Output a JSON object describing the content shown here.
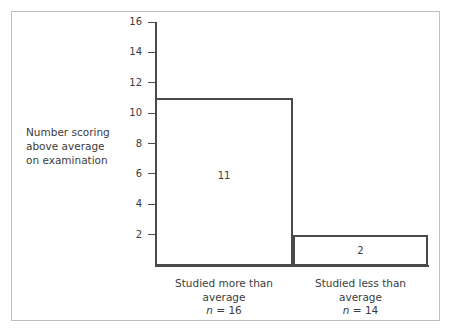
{
  "chart_data": {
    "type": "bar",
    "title": "",
    "subtitle": "",
    "xlabel": "",
    "ylabel": "Number scoring above average on examination",
    "ylabel_lines": [
      "Number scoring",
      "above average",
      "on examination"
    ],
    "categories": [
      "Studied more than average",
      "Studied less than average"
    ],
    "category_lines": [
      [
        "Studied more than",
        "average"
      ],
      [
        "Studied less than",
        "average"
      ]
    ],
    "category_n_labels": [
      "n = 16",
      "n = 14"
    ],
    "category_n_values": [
      16,
      14
    ],
    "values": [
      11,
      2
    ],
    "value_labels": [
      "11",
      "2"
    ],
    "ylim": [
      0,
      16
    ],
    "ytick_values": [
      2,
      4,
      6,
      8,
      10,
      12,
      14,
      16
    ],
    "ytick_labels": [
      "2",
      "4",
      "6",
      "8",
      "10",
      "12",
      "14",
      "16"
    ],
    "grid": false,
    "legend": null,
    "bar_fill_color": "#ffffff",
    "bar_border_color": "#4a4a4a",
    "axis_color": "#4a4a4a",
    "text_color": "#3c3c3c",
    "frame_border_color": "#bfbfbf",
    "background_color": "#ffffff"
  }
}
